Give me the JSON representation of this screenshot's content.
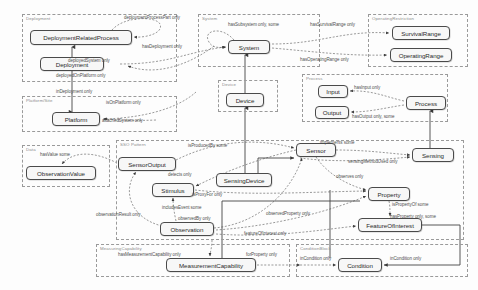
{
  "diagram": {
    "canvas": {
      "width": 478,
      "height": 290
    },
    "colors": {
      "module_border": "#9a9a9a",
      "class_border": "#4a4a4a",
      "class_fill": "#f7f7f7",
      "edge_dashed": "#6e6e6e",
      "edge_solid": "#444444",
      "label_text": "#4f4f4f",
      "module_title_text": "#8d8d8d"
    },
    "modules": [
      {
        "id": "deployment",
        "label": "Deployment",
        "x": 22,
        "y": 14,
        "w": 155,
        "h": 68
      },
      {
        "id": "platform-site",
        "label": "Platform/Site",
        "x": 22,
        "y": 96,
        "w": 155,
        "h": 36
      },
      {
        "id": "data",
        "label": "Data",
        "x": 22,
        "y": 145,
        "w": 88,
        "h": 42
      },
      {
        "id": "system",
        "label": "System",
        "x": 198,
        "y": 14,
        "w": 122,
        "h": 53
      },
      {
        "id": "operating-restriction",
        "label": "OperatingRestriction",
        "x": 368,
        "y": 14,
        "w": 100,
        "h": 53
      },
      {
        "id": "device",
        "label": "Device",
        "x": 218,
        "y": 80,
        "w": 60,
        "h": 32
      },
      {
        "id": "process",
        "label": "Process",
        "x": 302,
        "y": 74,
        "w": 146,
        "h": 48
      },
      {
        "id": "sso-pattern",
        "label": "SSO Pattern",
        "x": 116,
        "y": 140,
        "w": 348,
        "h": 100
      },
      {
        "id": "measuring-capability",
        "label": "MeasuringCapability",
        "x": 96,
        "y": 244,
        "w": 194,
        "h": 33
      },
      {
        "id": "condition",
        "label": "ConditionBlock",
        "x": 296,
        "y": 244,
        "w": 172,
        "h": 33
      }
    ],
    "classes": [
      {
        "id": "deployment-related-process",
        "label": "DeploymentRelatedProcess",
        "x": 30,
        "y": 30,
        "w": 102,
        "h": 15
      },
      {
        "id": "deployment",
        "label": "Deployment",
        "x": 40,
        "y": 57,
        "w": 64,
        "h": 14
      },
      {
        "id": "platform",
        "label": "Platform",
        "x": 52,
        "y": 112,
        "w": 48,
        "h": 14
      },
      {
        "id": "observation-value",
        "label": "ObservationValue",
        "x": 26,
        "y": 166,
        "w": 70,
        "h": 14
      },
      {
        "id": "system",
        "label": "System",
        "x": 228,
        "y": 40,
        "w": 42,
        "h": 14
      },
      {
        "id": "device",
        "label": "Device",
        "x": 226,
        "y": 93,
        "w": 38,
        "h": 14
      },
      {
        "id": "survival-range",
        "label": "SurvivalRange",
        "x": 392,
        "y": 26,
        "w": 58,
        "h": 14
      },
      {
        "id": "operating-range",
        "label": "OperatingRange",
        "x": 390,
        "y": 48,
        "w": 62,
        "h": 14
      },
      {
        "id": "input",
        "label": "Input",
        "x": 318,
        "y": 85,
        "w": 30,
        "h": 13
      },
      {
        "id": "output",
        "label": "Output",
        "x": 315,
        "y": 106,
        "w": 34,
        "h": 13
      },
      {
        "id": "process",
        "label": "Process",
        "x": 406,
        "y": 96,
        "w": 40,
        "h": 14
      },
      {
        "id": "sensor-output",
        "label": "SensorOutput",
        "x": 118,
        "y": 157,
        "w": 58,
        "h": 14
      },
      {
        "id": "stimulus",
        "label": "Stimulus",
        "x": 152,
        "y": 183,
        "w": 42,
        "h": 14
      },
      {
        "id": "sensing-device",
        "label": "SensingDevice",
        "x": 216,
        "y": 173,
        "w": 56,
        "h": 14
      },
      {
        "id": "sensor",
        "label": "Sensor",
        "x": 296,
        "y": 143,
        "w": 40,
        "h": 14
      },
      {
        "id": "sensing",
        "label": "Sensing",
        "x": 412,
        "y": 148,
        "w": 42,
        "h": 14
      },
      {
        "id": "observation",
        "label": "Observation",
        "x": 160,
        "y": 222,
        "w": 54,
        "h": 14
      },
      {
        "id": "property",
        "label": "Property",
        "x": 368,
        "y": 187,
        "w": 42,
        "h": 14
      },
      {
        "id": "feature-of-interest",
        "label": "FeatureOfInterest",
        "x": 358,
        "y": 218,
        "w": 64,
        "h": 14
      },
      {
        "id": "measurement-capability",
        "label": "MeasurementCapability",
        "x": 166,
        "y": 258,
        "w": 90,
        "h": 14
      },
      {
        "id": "condition",
        "label": "Condition",
        "x": 338,
        "y": 258,
        "w": 44,
        "h": 14
      }
    ],
    "edge_labels": [
      {
        "id": "deployment-process-part",
        "text": "deploymentProcessPart only",
        "x": 124,
        "y": 15
      },
      {
        "id": "has-deployment",
        "text": "hasDeployment only",
        "x": 142,
        "y": 44
      },
      {
        "id": "deployed-system",
        "text": "deployedSystem only",
        "x": 68,
        "y": 58
      },
      {
        "id": "deployed-on-platform",
        "text": "deployedOnPlatform only",
        "x": 56,
        "y": 73
      },
      {
        "id": "in-deployment",
        "text": "inDeployment only",
        "x": 56,
        "y": 89
      },
      {
        "id": "is-on-platform",
        "text": "isOnPlatform only",
        "x": 106,
        "y": 100
      },
      {
        "id": "attached-system",
        "text": "attachedSystem only",
        "x": 102,
        "y": 118
      },
      {
        "id": "has-subsystem",
        "text": "hasSubsystem only, some",
        "x": 228,
        "y": 22
      },
      {
        "id": "has-survival-range",
        "text": "hasSurvivalRange only",
        "x": 310,
        "y": 22
      },
      {
        "id": "has-operating-range",
        "text": "hasOperatingRange only",
        "x": 300,
        "y": 57
      },
      {
        "id": "has-input",
        "text": "hasInput only",
        "x": 354,
        "y": 85
      },
      {
        "id": "has-output",
        "text": "hasOutput only, some",
        "x": 352,
        "y": 114
      },
      {
        "id": "has-value",
        "text": "hasValue some",
        "x": 40,
        "y": 152
      },
      {
        "id": "is-produced-by",
        "text": "isProducedBy some",
        "x": 188,
        "y": 143
      },
      {
        "id": "implements",
        "text": "implements some",
        "x": 320,
        "y": 140
      },
      {
        "id": "sensing-method-used",
        "text": "sensingMethodUsed only",
        "x": 348,
        "y": 159
      },
      {
        "id": "detects",
        "text": "detects only",
        "x": 168,
        "y": 172
      },
      {
        "id": "is-proxy-for",
        "text": "isProxyFor only",
        "x": 192,
        "y": 192
      },
      {
        "id": "observes",
        "text": "observes only",
        "x": 336,
        "y": 174
      },
      {
        "id": "is-property-of",
        "text": "isPropertyOf some",
        "x": 392,
        "y": 202
      },
      {
        "id": "has-property",
        "text": "hasProperty only, some",
        "x": 390,
        "y": 214
      },
      {
        "id": "observation-result",
        "text": "observationResult only",
        "x": 96,
        "y": 212
      },
      {
        "id": "includes-event",
        "text": "includesEvent some",
        "x": 162,
        "y": 205
      },
      {
        "id": "observed-by",
        "text": "observedBy only",
        "x": 178,
        "y": 216
      },
      {
        "id": "observed-property",
        "text": "observedProperty only",
        "x": 266,
        "y": 211
      },
      {
        "id": "feature-of-interest-edge",
        "text": "featureOfInterest only",
        "x": 244,
        "y": 231
      },
      {
        "id": "has-measurement-capability",
        "text": "hasMeasurementCapability only",
        "x": 118,
        "y": 252
      },
      {
        "id": "for-property",
        "text": "forProperty only",
        "x": 246,
        "y": 252
      },
      {
        "id": "in-condition-left",
        "text": "inCondition only",
        "x": 300,
        "y": 256
      },
      {
        "id": "in-condition-right",
        "text": "inCondition only",
        "x": 390,
        "y": 256
      }
    ]
  }
}
